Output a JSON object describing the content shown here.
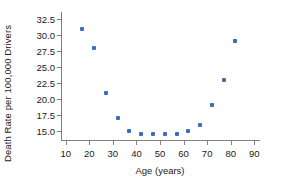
{
  "chart_data": {
    "type": "scatter",
    "title": "",
    "xlabel": "Age (years)",
    "ylabel": "Death Rate per 100,000 Drivers",
    "xlim": [
      8,
      92
    ],
    "ylim": [
      13.6,
      33.6
    ],
    "xticks": [
      10,
      20,
      30,
      40,
      50,
      60,
      70,
      80,
      90
    ],
    "yticks": [
      15.0,
      17.5,
      20.0,
      22.5,
      25.0,
      27.5,
      30.0,
      32.5
    ],
    "xtick_labels": [
      "10",
      "20",
      "30",
      "40",
      "50",
      "60",
      "70",
      "80",
      "90"
    ],
    "ytick_labels": [
      "15.0",
      "17.5",
      "20.0",
      "22.5",
      "25.0",
      "27.5",
      "30.0",
      "32.5"
    ],
    "grid": false,
    "legend": null,
    "marker_color": "#3b6cc4",
    "axis_color": "#808080",
    "text_color": "#1a1a1a",
    "x": [
      17,
      22,
      27,
      32,
      37,
      42,
      47,
      52,
      57,
      62,
      67,
      72,
      77,
      82
    ],
    "y": [
      31.0,
      28.0,
      21.0,
      17.0,
      15.0,
      14.5,
      14.5,
      14.5,
      14.5,
      15.0,
      16.0,
      19.0,
      23.0,
      29.0
    ],
    "points": [
      {
        "x": 17,
        "y": 31.0
      },
      {
        "x": 22,
        "y": 28.0
      },
      {
        "x": 27,
        "y": 21.0
      },
      {
        "x": 32,
        "y": 17.0
      },
      {
        "x": 37,
        "y": 15.0
      },
      {
        "x": 42,
        "y": 14.5
      },
      {
        "x": 47,
        "y": 14.5
      },
      {
        "x": 52,
        "y": 14.5
      },
      {
        "x": 57,
        "y": 14.5
      },
      {
        "x": 62,
        "y": 15.0
      },
      {
        "x": 67,
        "y": 16.0
      },
      {
        "x": 72,
        "y": 19.0
      },
      {
        "x": 77,
        "y": 23.0
      },
      {
        "x": 82,
        "y": 29.0
      }
    ]
  }
}
